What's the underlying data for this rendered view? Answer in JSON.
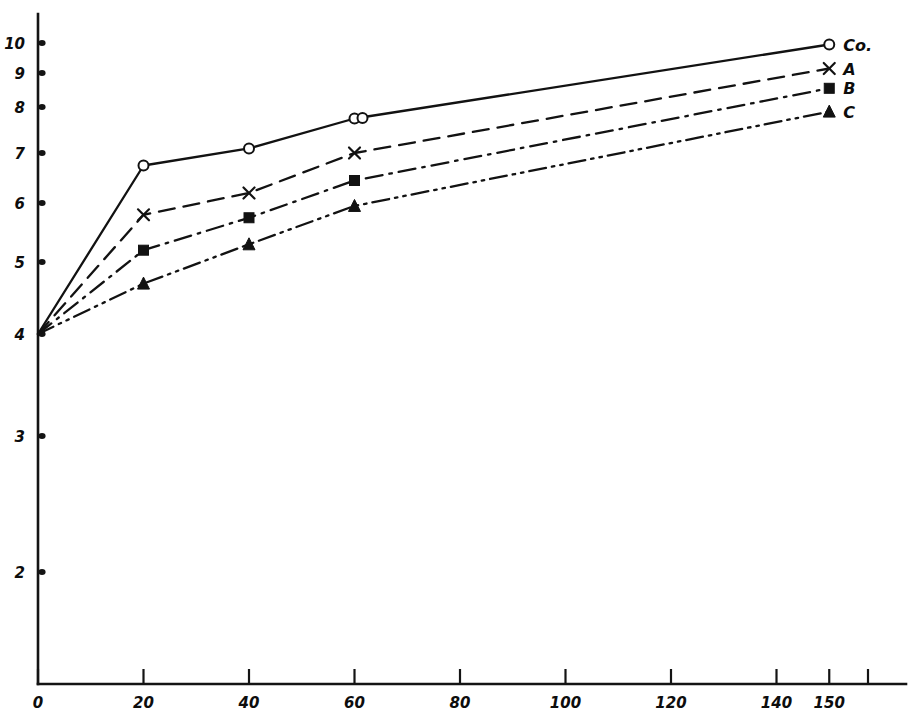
{
  "chart_data": {
    "type": "line",
    "title": "",
    "subtitle": "",
    "xlabel": "",
    "ylabel": "",
    "xlim": [
      0,
      170
    ],
    "ylim": [
      0,
      10.6
    ],
    "grid": false,
    "legend_position": "right-end-of-line",
    "style": "hand-drawn",
    "x": [
      0,
      20,
      40,
      60,
      150
    ],
    "x_tick_values": [
      0,
      20,
      40,
      60,
      80,
      100,
      120,
      140,
      150
    ],
    "x_tick_labels": [
      "0",
      "20",
      "40",
      "60",
      "80",
      "100",
      "120",
      "140",
      "150"
    ],
    "y_tick_values": [
      2,
      3,
      4,
      5,
      6,
      7,
      8,
      9,
      10
    ],
    "y_tick_labels": [
      "2",
      "3",
      "4",
      "5",
      "6",
      "7",
      "8",
      "9",
      "10"
    ],
    "series": [
      {
        "name": "Co.",
        "label": "Co.",
        "marker": "open-circle",
        "line_style": "solid",
        "values": [
          4.0,
          6.75,
          7.1,
          7.75,
          9.95
        ],
        "note": "double open circle marker at x=60"
      },
      {
        "name": "A",
        "label": "A",
        "marker": "cross",
        "line_style": "dashed",
        "values": [
          4.0,
          5.8,
          6.2,
          7.0,
          9.15
        ]
      },
      {
        "name": "B",
        "label": "B",
        "marker": "filled-square",
        "line_style": "dash-dot",
        "values": [
          4.0,
          5.2,
          5.75,
          6.45,
          8.55
        ]
      },
      {
        "name": "C",
        "label": "C",
        "marker": "filled-triangle",
        "line_style": "dash-dot-dot",
        "values": [
          4.0,
          4.7,
          5.3,
          5.95,
          7.9
        ]
      }
    ]
  },
  "colors": {
    "ink": "#121212",
    "paper": "#ffffff"
  }
}
